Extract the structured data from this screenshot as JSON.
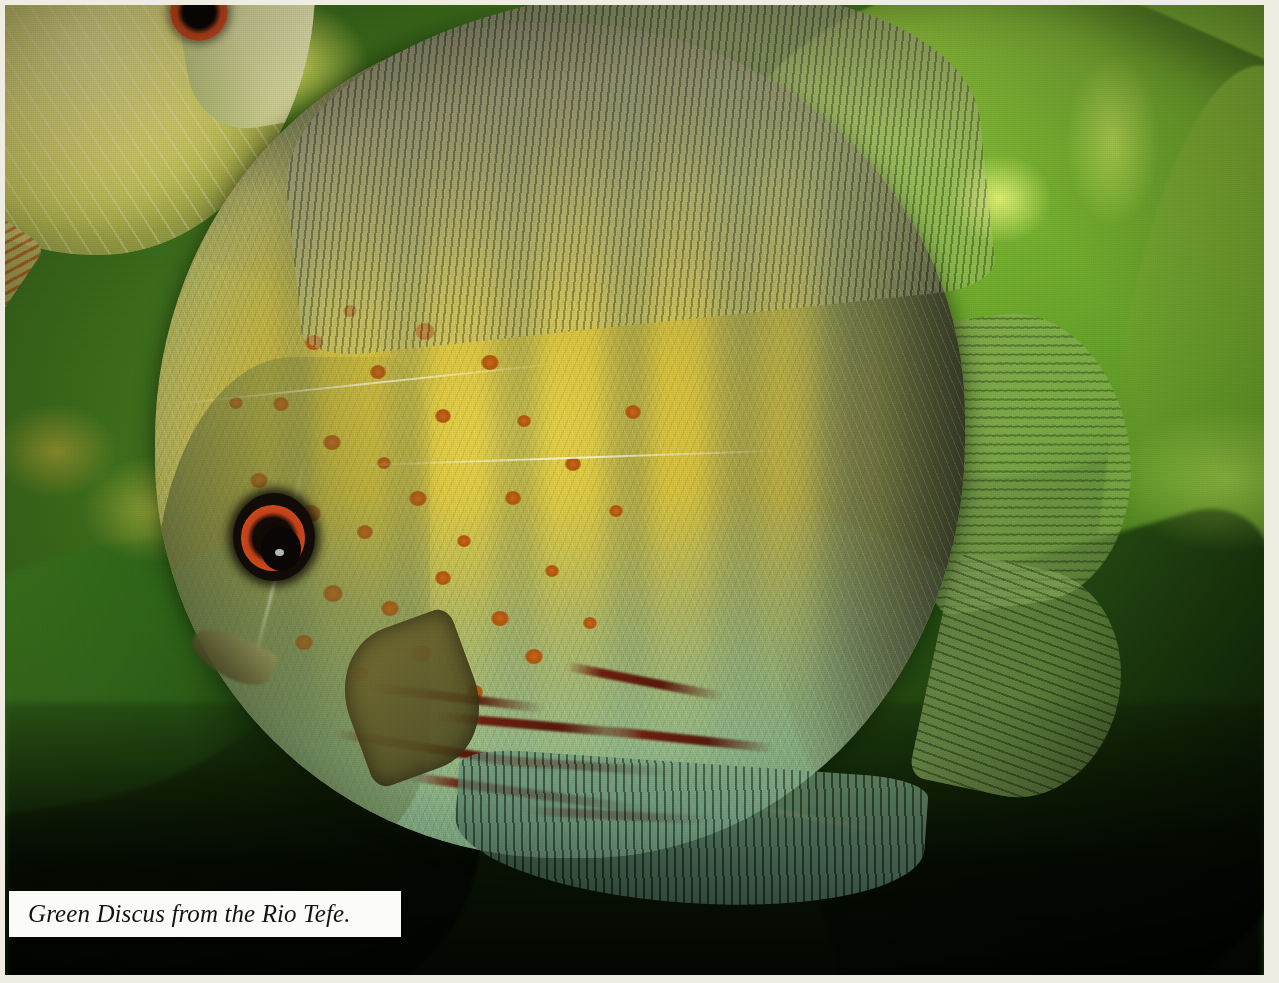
{
  "page": {
    "width": 1279,
    "height": 983,
    "border_color": "#efede2",
    "kind": "printed-photograph-plate"
  },
  "caption": {
    "text": "Green Discus from the Rio Tefe.",
    "style": "italic-serif",
    "text_color": "#131313",
    "background_color": "#fbfbf7"
  },
  "scene": {
    "subject": "Green Discus (Symphysodon aequifasciatus) in planted aquarium",
    "locality": "Rio Tefe",
    "background_colors": {
      "leaf_bright": "#8ec63f",
      "leaf_mid": "#5f9a28",
      "leaf_dark": "#1d3c0d",
      "shadow": "#050803",
      "backlight_yellow": "#e6e45a",
      "stem_rust": "#ba6024"
    }
  },
  "main_fish": {
    "name": "green-discus-primary",
    "body_colors": {
      "flank_gold": "#e8d44a",
      "scale_cream": "#d9cc4c",
      "ventral_turquoise": "#96c49e",
      "dorsal_shoulder": "#48423 4",
      "bar_green": "#6e7a5c",
      "stripe_red": "#6d2010",
      "spot_orange": "#c96a18"
    },
    "eye": {
      "name": "eye-primary",
      "iris_color": "#d4501f",
      "pupil_color": "#0a0605",
      "x": 245,
      "y": 525
    },
    "fins": [
      {
        "name": "dorsal-fin",
        "color": "#7e7e5c"
      },
      {
        "name": "caudal-fin",
        "color": "#7aa04a"
      },
      {
        "name": "pectoral-fin",
        "color": "#766e32"
      },
      {
        "name": "anal-fin",
        "color": "#466e5a"
      }
    ],
    "vertical_bars": [
      {
        "left_pct": 14,
        "width_pct": 7,
        "opacity": 0.42
      },
      {
        "left_pct": 27,
        "width_pct": 8,
        "opacity": 0.46
      },
      {
        "left_pct": 40,
        "width_pct": 9,
        "opacity": 0.5
      },
      {
        "left_pct": 54,
        "width_pct": 9,
        "opacity": 0.54
      },
      {
        "left_pct": 67,
        "width_pct": 10,
        "opacity": 0.58
      },
      {
        "left_pct": 80,
        "width_pct": 10,
        "opacity": 0.62
      }
    ],
    "orange_spots": [
      {
        "x": 300,
        "y": 330,
        "r": 9
      },
      {
        "x": 338,
        "y": 300,
        "r": 7
      },
      {
        "x": 365,
        "y": 360,
        "r": 8
      },
      {
        "x": 410,
        "y": 318,
        "r": 10
      },
      {
        "x": 268,
        "y": 392,
        "r": 8
      },
      {
        "x": 318,
        "y": 430,
        "r": 9
      },
      {
        "x": 372,
        "y": 452,
        "r": 7
      },
      {
        "x": 430,
        "y": 404,
        "r": 8
      },
      {
        "x": 476,
        "y": 350,
        "r": 9
      },
      {
        "x": 512,
        "y": 410,
        "r": 7
      },
      {
        "x": 245,
        "y": 468,
        "r": 9
      },
      {
        "x": 296,
        "y": 500,
        "r": 10
      },
      {
        "x": 352,
        "y": 520,
        "r": 8
      },
      {
        "x": 404,
        "y": 486,
        "r": 9
      },
      {
        "x": 452,
        "y": 530,
        "r": 7
      },
      {
        "x": 500,
        "y": 486,
        "r": 8
      },
      {
        "x": 262,
        "y": 548,
        "r": 8
      },
      {
        "x": 318,
        "y": 580,
        "r": 10
      },
      {
        "x": 376,
        "y": 596,
        "r": 9
      },
      {
        "x": 430,
        "y": 566,
        "r": 8
      },
      {
        "x": 486,
        "y": 606,
        "r": 9
      },
      {
        "x": 540,
        "y": 560,
        "r": 7
      },
      {
        "x": 290,
        "y": 630,
        "r": 9
      },
      {
        "x": 348,
        "y": 662,
        "r": 8
      },
      {
        "x": 406,
        "y": 640,
        "r": 10
      },
      {
        "x": 462,
        "y": 680,
        "r": 8
      },
      {
        "x": 520,
        "y": 644,
        "r": 9
      },
      {
        "x": 578,
        "y": 612,
        "r": 7
      },
      {
        "x": 224,
        "y": 392,
        "r": 7
      },
      {
        "x": 560,
        "y": 452,
        "r": 8
      },
      {
        "x": 604,
        "y": 500,
        "r": 7
      },
      {
        "x": 620,
        "y": 400,
        "r": 8
      }
    ],
    "red_stripes": [
      {
        "x": 360,
        "y": 688,
        "w": 180,
        "rot": 7
      },
      {
        "x": 430,
        "y": 716,
        "w": 210,
        "rot": 5
      },
      {
        "x": 330,
        "y": 742,
        "w": 230,
        "rot": 9
      },
      {
        "x": 470,
        "y": 756,
        "w": 200,
        "rot": 4
      },
      {
        "x": 400,
        "y": 784,
        "w": 250,
        "rot": 8
      },
      {
        "x": 520,
        "y": 806,
        "w": 190,
        "rot": 3
      },
      {
        "x": 560,
        "y": 672,
        "w": 160,
        "rot": 11
      },
      {
        "x": 600,
        "y": 730,
        "w": 170,
        "rot": 6
      }
    ],
    "lateral_lines": [
      {
        "x": 170,
        "y": 378,
        "w": 380,
        "rot": -6
      },
      {
        "x": 350,
        "y": 452,
        "w": 430,
        "rot": -2
      }
    ]
  },
  "second_fish": {
    "name": "green-discus-secondary",
    "position": "top-left-corner",
    "body_color": "#e6e07a",
    "eye": {
      "name": "eye-secondary",
      "iris_color": "#cf5321",
      "x": 140,
      "y": 12
    }
  }
}
